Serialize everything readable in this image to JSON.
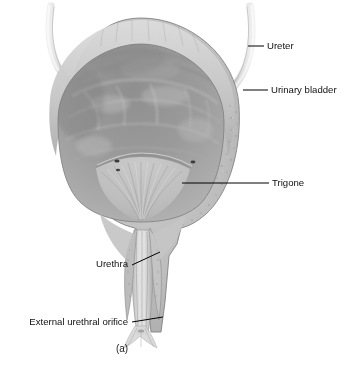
{
  "figure": {
    "caption": "(a)",
    "background_color": "#ffffff",
    "line_color": "#000000",
    "text_color": "#111111"
  },
  "palette": {
    "wall_outer": "#b9b9b9",
    "wall_light_band": "#cfcfcf",
    "wall_shadow": "#8e8e8e",
    "lumen_upper": "#9c9c9c",
    "lumen_lower": "#b5b5b5",
    "trigone": "#c2c2c2",
    "urethra": "#c9c9c9",
    "ureter_tube": "#d2d2d2",
    "orifice_dark": "#3a3a3a",
    "outline": "#6f6f6f"
  },
  "labels": [
    {
      "id": "ureter",
      "text": "Ureter",
      "anchor": "start",
      "text_x": 267,
      "text_y": 46,
      "leader": "M248,46 L264,46"
    },
    {
      "id": "urinary-bladder",
      "text": "Urinary bladder",
      "anchor": "start",
      "text_x": 271,
      "text_y": 90,
      "leader": "M243,90 L268,90"
    },
    {
      "id": "trigone",
      "text": "Trigone",
      "anchor": "start",
      "text_x": 272,
      "text_y": 183,
      "leader": "M182,183 L269,183"
    },
    {
      "id": "urethra",
      "text": "Urethra",
      "anchor": "end",
      "text_x": 128,
      "text_y": 264,
      "leader": "M132,265 L160,252"
    },
    {
      "id": "external-urethral-orifice",
      "text": "External urethral orifice",
      "anchor": "end",
      "text_x": 128,
      "text_y": 322,
      "leader": "M132,322 L163,317"
    }
  ],
  "structures": [
    {
      "id": "left-ureter",
      "name": "left ureter tube"
    },
    {
      "id": "right-ureter",
      "name": "right ureter tube"
    },
    {
      "id": "bladder-wall",
      "name": "detrusor muscle wall"
    },
    {
      "id": "bladder-lumen",
      "name": "bladder lumen with rugae"
    },
    {
      "id": "trigone-area",
      "name": "trigone"
    },
    {
      "id": "left-ureteric-orifice",
      "name": "left ureteric orifice"
    },
    {
      "id": "right-ureteric-orifice",
      "name": "right ureteric orifice"
    },
    {
      "id": "urethra-canal",
      "name": "urethra"
    },
    {
      "id": "orifice-opening",
      "name": "external urethral orifice"
    }
  ],
  "caption_position": {
    "x": 122,
    "y": 352
  }
}
